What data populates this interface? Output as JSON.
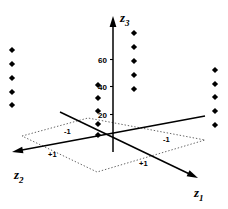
{
  "figure": {
    "kind": "3d-scatter-design-plot",
    "background": "#ffffff",
    "ink": "#000000",
    "plane_ink": "#555555"
  },
  "axes": {
    "z3": {
      "label": "z",
      "sub": "3",
      "label_x": 120,
      "label_y": 11,
      "arrow": true,
      "x": 113,
      "y_top": 16,
      "y_bottom": 152,
      "ticks": [
        {
          "text": "60",
          "x": 98,
          "y": 57
        },
        {
          "text": "40",
          "x": 98,
          "y": 84
        },
        {
          "text": "20",
          "x": 98,
          "y": 112
        }
      ]
    },
    "z1": {
      "label": "z",
      "sub": "1",
      "label_x": 194,
      "label_y": 186,
      "arrow": true,
      "x1": 60,
      "y1": 112,
      "x2": 198,
      "y2": 178,
      "ticks": [
        {
          "text": "-1",
          "x": 163,
          "y": 136
        },
        {
          "text": "+1",
          "x": 139,
          "y": 160
        }
      ]
    },
    "z2": {
      "label": "z",
      "sub": "2",
      "label_x": 14,
      "label_y": 168,
      "arrow": true,
      "x1": 12,
      "y1": 152,
      "x2": 205,
      "y2": 116,
      "ticks": [
        {
          "text": "-1",
          "x": 64,
          "y": 128
        },
        {
          "text": "+1",
          "x": 48,
          "y": 151
        }
      ]
    }
  },
  "base_plane": {
    "style": "dotted",
    "vertices": [
      {
        "x": 22,
        "y": 136
      },
      {
        "x": 88,
        "y": 118
      },
      {
        "x": 205,
        "y": 140
      },
      {
        "x": 97,
        "y": 172
      }
    ]
  },
  "clusters": [
    {
      "name": "cluster-left",
      "corner": "z1=+1,z2=+1",
      "x": 12,
      "points_y": [
        50,
        64,
        78,
        92,
        105
      ],
      "count": 5
    },
    {
      "name": "cluster-center-left",
      "corner": "z1=+1,z2=-1",
      "x": 98,
      "points_y": [
        85,
        98,
        111,
        124,
        135
      ],
      "count": 5
    },
    {
      "name": "cluster-center-right",
      "corner": "z1=-1,z2=-1",
      "x": 134,
      "points_y": [
        33,
        47,
        61,
        75,
        89
      ],
      "count": 5
    },
    {
      "name": "cluster-right",
      "corner": "z1=-1,z2=+1",
      "x": 215,
      "points_y": [
        70,
        84,
        97,
        111,
        125
      ],
      "count": 5
    }
  ],
  "marker": {
    "shape": "diamond",
    "size": 3.1,
    "color": "#000000"
  },
  "chart_data": {
    "type": "scatter",
    "title": "",
    "xlabel": "z1",
    "ylabel": "z2",
    "zlabel": "z3",
    "z3_ticks": [
      20,
      40,
      60
    ],
    "z1_ticks": [
      "-1",
      "+1"
    ],
    "z2_ticks": [
      "-1",
      "+1"
    ],
    "grid": false,
    "legend": "none",
    "note": "Four vertical stacks of five replicate points located over the four corners (z1,z2) = (+1,+1), (+1,-1), (-1,-1), (-1,+1) of the square design region; vertical coordinate is response z3.",
    "series": [
      {
        "name": "(z1=+1, z2=+1)",
        "z1": 1,
        "z2": 1,
        "z3_values": [
          72,
          62,
          52,
          42,
          33
        ]
      },
      {
        "name": "(z1=+1, z2=-1)",
        "z1": 1,
        "z2": -1,
        "z3_values": [
          46,
          36,
          27,
          18,
          10
        ]
      },
      {
        "name": "(z1=-1, z2=-1)",
        "z1": -1,
        "z2": -1,
        "z3_values": [
          84,
          74,
          64,
          54,
          44
        ]
      },
      {
        "name": "(z1=-1, z2=+1)",
        "z1": -1,
        "z2": 1,
        "z3_values": [
          57,
          47,
          38,
          28,
          18
        ]
      }
    ]
  }
}
